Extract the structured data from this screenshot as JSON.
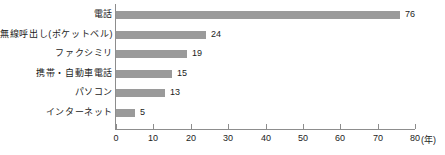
{
  "chart_data": {
    "type": "bar",
    "orientation": "horizontal",
    "title": "",
    "subtitle": "",
    "xlabel": "年",
    "ylabel": "",
    "xlim": [
      0,
      80
    ],
    "xticks": [
      0,
      10,
      20,
      30,
      40,
      50,
      60,
      70,
      80
    ],
    "xtick_labels": [
      "0",
      "10",
      "20",
      "30",
      "40",
      "50",
      "60",
      "70",
      "80"
    ],
    "x_unit_label": "(年)",
    "grid": false,
    "legend": false,
    "bar_color": "#9a9a9a",
    "axis_color": "#8d8d8d",
    "text_color": "#1c1c1c",
    "background_color": "#ffffff",
    "categories": [
      "電話",
      "無線呼出し(ポケットベル)",
      "ファクシミリ",
      "携帯・自動車電話",
      "パソコン",
      "インターネット"
    ],
    "values": [
      76,
      24,
      19,
      15,
      13,
      5
    ],
    "value_labels": [
      "76",
      "24",
      "19",
      "15",
      "13",
      "5"
    ]
  }
}
